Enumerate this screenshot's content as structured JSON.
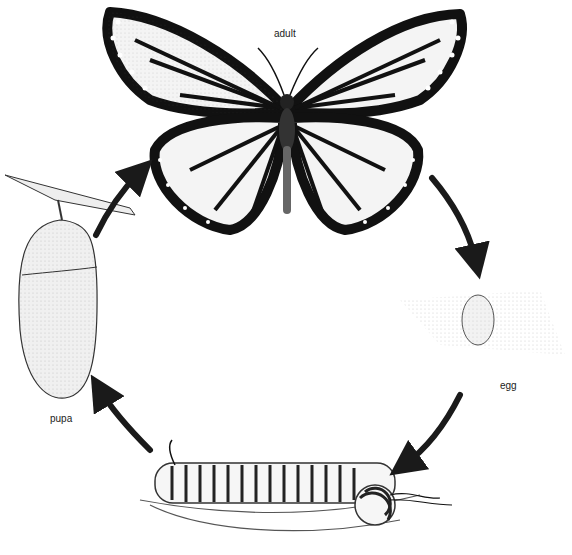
{
  "diagram": {
    "type": "life-cycle",
    "stages": [
      {
        "id": "adult",
        "label": "adult"
      },
      {
        "id": "egg",
        "label": "egg"
      },
      {
        "id": "larva",
        "label": ""
      },
      {
        "id": "pupa",
        "label": "pupa"
      }
    ],
    "flow": [
      "adult",
      "egg",
      "larva",
      "pupa",
      "adult"
    ],
    "colors": {
      "ink": "#1a1a1a",
      "background": "#ffffff"
    }
  }
}
